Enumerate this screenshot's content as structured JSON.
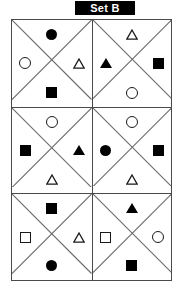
{
  "title": {
    "label": "Set B"
  },
  "grid": {
    "columns": 2,
    "rows": 3,
    "cell_pattern": "x-divided-into-four-triangles",
    "cells": [
      {
        "id": "cell-1",
        "position": "top-left",
        "top": "circle-filled",
        "left": "circle-open",
        "right": "triangle-open",
        "bottom": "square-filled"
      },
      {
        "id": "cell-2",
        "position": "top-right",
        "top": "triangle-open",
        "left": "triangle-filled",
        "right": "square-filled",
        "bottom": "circle-open"
      },
      {
        "id": "cell-3",
        "position": "middle-left",
        "top": "circle-open",
        "left": "square-filled",
        "right": "triangle-filled",
        "bottom": "triangle-open"
      },
      {
        "id": "cell-4",
        "position": "middle-right",
        "top": "circle-open",
        "left": "circle-filled",
        "right": "square-filled",
        "bottom": "triangle-open"
      },
      {
        "id": "cell-5",
        "position": "bottom-left",
        "top": "square-filled",
        "left": "square-open",
        "right": "triangle-open",
        "bottom": "circle-filled"
      },
      {
        "id": "cell-6",
        "position": "bottom-right",
        "top": "triangle-filled",
        "left": "square-open",
        "right": "circle-open",
        "bottom": "square-filled"
      }
    ]
  },
  "colors": {
    "shape_fill": "#000000",
    "shape_stroke": "#1a1a1a",
    "grid_line": "#4a4a4a",
    "diagonal_line": "#6a6a6a",
    "banner_bg": "#000000",
    "banner_text": "#ffffff",
    "background": "#ffffff"
  }
}
